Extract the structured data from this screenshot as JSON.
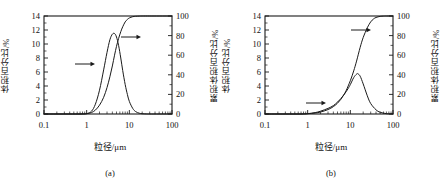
{
  "figure": {
    "background": "#ffffff",
    "ink_color": "#1a1a1a"
  },
  "panels": [
    {
      "id": "a",
      "caption": "(a)",
      "xlabel": "粒径/μm",
      "ylabel_left": "体积百分比/%",
      "ylabel_right": "累积体积百分比/%"
    },
    {
      "id": "b",
      "caption": "(b)",
      "xlabel": "粒径/μm",
      "ylabel_left": "体积百分比/%",
      "ylabel_right": "累积体积百分比/%"
    }
  ],
  "chart_data": [
    {
      "type": "line",
      "panel": "a",
      "title": "(a)",
      "xlabel": "粒径/μm",
      "ylabel": "体积百分比/%",
      "ylabel_secondary": "累积体积百分比/%",
      "xscale": "log",
      "xlim": [
        0.1,
        100
      ],
      "ylim": [
        0,
        14
      ],
      "ylim_secondary": [
        0,
        100
      ],
      "xticks": [
        0.1,
        1,
        10,
        100
      ],
      "xtick_labels": [
        "0.1",
        "1",
        "10",
        "100"
      ],
      "yticks": [
        0,
        2,
        4,
        6,
        8,
        10,
        12,
        14
      ],
      "yticks_secondary": [
        0,
        20,
        40,
        60,
        80,
        100
      ],
      "grid": false,
      "legend": "none",
      "annotations": [
        {
          "text": "arrow-left-series",
          "icon": "arrow-right-icon",
          "points_to": "left-axis-curve"
        },
        {
          "text": "arrow-right-series",
          "icon": "arrow-right-icon",
          "points_to": "right-axis-curve"
        }
      ],
      "series": [
        {
          "name": "体积百分比 (differential)",
          "axis": "left",
          "x": [
            0.1,
            0.2,
            0.4,
            0.7,
            1.0,
            1.3,
            1.6,
            2.0,
            2.5,
            3.0,
            3.5,
            4.0,
            4.5,
            5.0,
            5.6,
            6.3,
            7.0,
            8.0,
            9.0,
            10.0,
            12.0,
            14.0,
            17.0,
            20.0,
            25.0,
            30.0,
            50.0,
            100.0
          ],
          "values": [
            0,
            0,
            0,
            0,
            0.05,
            0.4,
            1.4,
            3.4,
            6.3,
            8.8,
            10.6,
            11.4,
            11.5,
            11.0,
            9.8,
            8.0,
            6.2,
            4.2,
            2.8,
            1.8,
            0.8,
            0.35,
            0.12,
            0.04,
            0.01,
            0,
            0,
            0
          ]
        },
        {
          "name": "累积体积百分比 (cumulative)",
          "axis": "right",
          "x": [
            0.1,
            0.3,
            0.7,
            1.0,
            1.3,
            1.6,
            2.0,
            2.5,
            3.0,
            3.5,
            4.0,
            4.5,
            5.0,
            5.6,
            6.3,
            7.0,
            8.0,
            9.0,
            10.0,
            12.0,
            14.0,
            17.0,
            20.0,
            30.0,
            50.0,
            100.0
          ],
          "values": [
            0,
            0,
            0,
            0.3,
            1.5,
            4.0,
            9.0,
            17.0,
            27.0,
            38.0,
            49.0,
            60.0,
            69.0,
            77.0,
            84.0,
            89.0,
            94.0,
            96.5,
            98.0,
            99.3,
            99.7,
            99.9,
            100,
            100,
            100,
            100
          ]
        }
      ]
    },
    {
      "type": "line",
      "panel": "b",
      "title": "(b)",
      "xlabel": "粒径/μm",
      "ylabel": "体积百分比/%",
      "ylabel_secondary": "累积体积百分比/%",
      "xscale": "log",
      "xlim": [
        0.1,
        100
      ],
      "ylim": [
        0,
        14
      ],
      "ylim_secondary": [
        0,
        100
      ],
      "xticks": [
        0.1,
        1,
        10,
        100
      ],
      "xtick_labels": [
        "0.1",
        "1",
        "10",
        "100"
      ],
      "yticks": [
        0,
        2,
        4,
        6,
        8,
        10,
        12,
        14
      ],
      "yticks_secondary": [
        0,
        20,
        40,
        60,
        80,
        100
      ],
      "grid": false,
      "legend": "none",
      "annotations": [
        {
          "text": "arrow-left-series",
          "icon": "arrow-right-icon",
          "points_to": "left-axis-curve"
        },
        {
          "text": "arrow-right-series",
          "icon": "arrow-right-icon",
          "points_to": "right-axis-curve"
        }
      ],
      "series": [
        {
          "name": "体积百分比 (differential)",
          "axis": "left",
          "x": [
            0.1,
            0.3,
            0.7,
            1.0,
            1.5,
            2.0,
            3.0,
            4.0,
            5.0,
            6.0,
            7.0,
            8.0,
            9.0,
            10.0,
            12.0,
            14.0,
            15.0,
            17.0,
            20.0,
            25.0,
            30.0,
            40.0,
            50.0,
            70.0,
            100.0
          ],
          "values": [
            0,
            0,
            0,
            0.05,
            0.2,
            0.4,
            0.8,
            1.2,
            1.7,
            2.2,
            2.7,
            3.2,
            3.7,
            4.2,
            5.2,
            5.7,
            5.75,
            5.4,
            4.3,
            2.6,
            1.5,
            0.6,
            0.25,
            0.05,
            0
          ]
        },
        {
          "name": "累积体积百分比 (cumulative)",
          "axis": "right",
          "x": [
            0.1,
            0.3,
            0.7,
            1.0,
            1.5,
            2.0,
            3.0,
            4.0,
            5.0,
            6.0,
            7.0,
            8.0,
            10.0,
            12.0,
            14.0,
            17.0,
            20.0,
            25.0,
            30.0,
            35.0,
            40.0,
            50.0,
            60.0,
            70.0,
            100.0
          ],
          "values": [
            0,
            0,
            0,
            0.3,
            1.0,
            2.0,
            4.5,
            7.5,
            11.0,
            15.0,
            19.5,
            24.0,
            34.0,
            44.0,
            54.0,
            68.0,
            78.0,
            88.0,
            94.0,
            97.0,
            98.5,
            99.6,
            99.9,
            100,
            100
          ]
        }
      ]
    }
  ]
}
